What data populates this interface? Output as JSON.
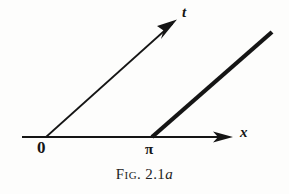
{
  "figure": {
    "caption_prefix": "Fig.",
    "caption_number": "2.1",
    "caption_suffix": "a",
    "background_color": "#fdfdfc",
    "ink_color": "#151515"
  },
  "diagram": {
    "type": "line-diagram",
    "axes": [
      {
        "name": "x-axis",
        "label": "x",
        "from": [
          22,
          137
        ],
        "to": [
          232,
          137
        ],
        "arrow": true,
        "stroke_width": 2.0
      },
      {
        "name": "t-axis",
        "label": "t",
        "from": [
          46,
          137
        ],
        "to": [
          176,
          20
        ],
        "arrow": true,
        "stroke_width": 1.6
      }
    ],
    "rays": [
      {
        "name": "characteristic-line",
        "from": [
          152,
          137
        ],
        "to": [
          272,
          32
        ],
        "arrow": false,
        "stroke_width": 4.2
      }
    ],
    "tick_labels": [
      {
        "name": "origin",
        "text": "0",
        "x": 46,
        "y": 137
      },
      {
        "name": "pi-point",
        "text": "π",
        "x": 152,
        "y": 137
      }
    ]
  }
}
